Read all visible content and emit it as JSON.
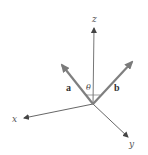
{
  "diagram": {
    "axes": {
      "x": {
        "label": "x"
      },
      "y": {
        "label": "y"
      },
      "z": {
        "label": "z"
      }
    },
    "vectors": {
      "a": {
        "label": "a"
      },
      "b": {
        "label": "b"
      }
    },
    "angle": {
      "label": "θ"
    },
    "colors": {
      "axis": "#555555",
      "vector": "#808080",
      "background": "#ffffff"
    }
  }
}
